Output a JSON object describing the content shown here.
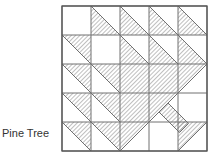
{
  "block": {
    "label": "Pine Tree",
    "grid_size": 5,
    "origin": [
      62,
      6
    ],
    "cell_px": 29,
    "line_color": "#707070",
    "hatch_color": "#8a8a8a",
    "legend": {
      "blank": "empty square",
      "ll": "diagonal top-left to bottom-right, lower-left half hatched",
      "ur": "diagonal top-left to bottom-right, upper-right half hatched",
      "ul": "diagonal top-right to bottom-left, upper-left half hatched",
      "full": "fully hatched square"
    },
    "rows": [
      [
        "blank",
        "ll",
        "ll",
        "ll",
        "ll"
      ],
      [
        "ur",
        "blank",
        "ll",
        "ll",
        "ll"
      ],
      [
        "ur",
        "ur",
        "full",
        "full",
        "ul"
      ],
      [
        "ur",
        "ur",
        "full",
        "ul",
        "blank"
      ],
      [
        "ur",
        "ur",
        "ul",
        "blank",
        "ul"
      ]
    ],
    "trunk": {
      "description": "diagonal band from center of cell row 3 col 3 to top-left of cell row 4 col 4"
    }
  }
}
